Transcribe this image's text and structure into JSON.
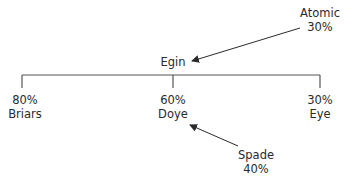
{
  "diagram": {
    "root": {
      "label": "Egin"
    },
    "children": [
      {
        "name": "Briars",
        "share": "80%"
      },
      {
        "name": "Doye",
        "share": "60%"
      },
      {
        "name": "Eye",
        "share": "30%"
      }
    ],
    "external": [
      {
        "name": "Atomic",
        "share": "30%",
        "points_to": "Egin"
      },
      {
        "name": "Spade",
        "share": "40%",
        "points_to": "Doye"
      }
    ],
    "line_color": "#3a3a3a"
  }
}
